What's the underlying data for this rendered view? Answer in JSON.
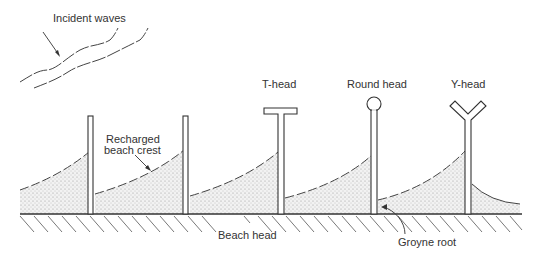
{
  "diagram": {
    "labels": {
      "incident_waves": "Incident waves",
      "recharged_crest_line1": "Recharged",
      "recharged_crest_line2": "beach crest",
      "t_head": "T-head",
      "round_head": "Round head",
      "y_head": "Y-head",
      "beach_head": "Beach head",
      "groyne_root": "Groyne root"
    },
    "groynes": [
      {
        "type": "straight",
        "x": 91
      },
      {
        "type": "straight",
        "x": 186
      },
      {
        "type": "t-head",
        "x": 281
      },
      {
        "type": "round-head",
        "x": 374
      },
      {
        "type": "y-head",
        "x": 468
      }
    ],
    "colors": {
      "line": "#333333",
      "sand": "#d8d8d8"
    }
  }
}
